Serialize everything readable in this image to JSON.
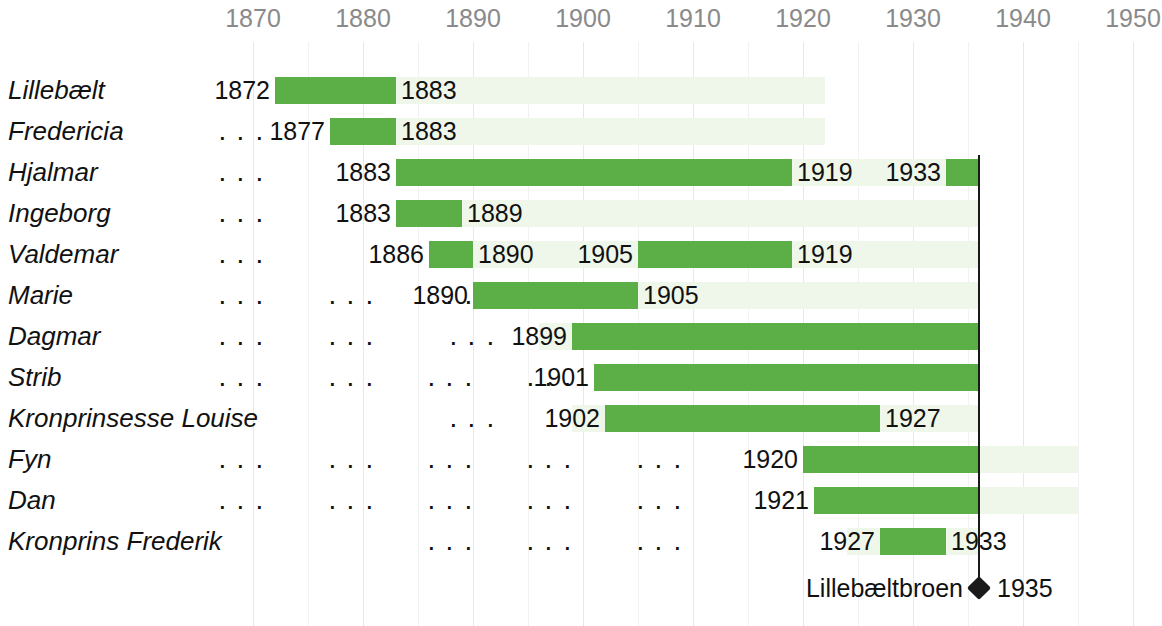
{
  "chart_data": {
    "type": "bar",
    "subtype": "gantt-timeline",
    "title": "",
    "xlabel": "",
    "ylabel": "",
    "xlim": [
      1865,
      1952
    ],
    "grid": true,
    "legend_position": "bottom-right",
    "axis": {
      "ticks": [
        1870,
        1880,
        1890,
        1900,
        1910,
        1920,
        1930,
        1940,
        1950
      ],
      "minor_ticks": [
        1875,
        1885,
        1895,
        1905,
        1915,
        1925,
        1935,
        1945
      ],
      "tick_color": "#8A8A8A"
    },
    "colors": {
      "bar": "#5CAF46",
      "band": "#EFF7EA",
      "gridline": "#E8E8E8",
      "text": "#111111",
      "milestone": "#1A1A1A"
    },
    "categories": [
      "Lillebælt",
      "Fredericia",
      "Hjalmar",
      "Ingeborg",
      "Valdemar",
      "Marie",
      "Dagmar",
      "Strib",
      "Kronprinsesse Louise",
      "Fyn",
      "Dan",
      "Kronprins Frederik"
    ],
    "rows": [
      {
        "label": "Lillebælt",
        "dots": [],
        "band": [
          1872,
          1922
        ],
        "segments": [
          {
            "start": 1872,
            "end": 1883,
            "start_label": "1872",
            "end_label": "1883"
          }
        ]
      },
      {
        "label": "Fredericia",
        "dots": [
          1869
        ],
        "band": [
          1877,
          1922
        ],
        "segments": [
          {
            "start": 1877,
            "end": 1883,
            "start_label": "1877",
            "end_label": "1883"
          }
        ]
      },
      {
        "label": "Hjalmar",
        "dots": [
          1869
        ],
        "band": [
          1883,
          1936
        ],
        "segments": [
          {
            "start": 1883,
            "end": 1919,
            "start_label": "1883",
            "end_label": "1919"
          },
          {
            "start": 1933,
            "end": 1936,
            "start_label": "1933",
            "end_label": ""
          }
        ]
      },
      {
        "label": "Ingeborg",
        "dots": [
          1869
        ],
        "band": [
          1883,
          1936
        ],
        "segments": [
          {
            "start": 1883,
            "end": 1889,
            "start_label": "1883",
            "end_label": "1889"
          }
        ]
      },
      {
        "label": "Valdemar",
        "dots": [
          1869
        ],
        "band": [
          1886,
          1936
        ],
        "segments": [
          {
            "start": 1886,
            "end": 1890,
            "start_label": "1886",
            "end_label": "1890"
          },
          {
            "start": 1905,
            "end": 1919,
            "start_label": "1905",
            "end_label": "1919"
          }
        ]
      },
      {
        "label": "Marie",
        "dots": [
          1869,
          1879,
          1888
        ],
        "band": [
          1890,
          1936
        ],
        "segments": [
          {
            "start": 1890,
            "end": 1905,
            "start_label": "1890",
            "end_label": "1905"
          }
        ]
      },
      {
        "label": "Dagmar",
        "dots": [
          1869,
          1879,
          1890
        ],
        "band": [
          1896,
          1936
        ],
        "segments": [
          {
            "start": 1899,
            "end": 1936,
            "start_label": "1899",
            "end_label": ""
          }
        ]
      },
      {
        "label": "Strib",
        "dots": [
          1869,
          1879,
          1888,
          1897
        ],
        "band": [
          1901,
          1936
        ],
        "segments": [
          {
            "start": 1901,
            "end": 1936,
            "start_label": "1901",
            "end_label": ""
          }
        ]
      },
      {
        "label": "Kronprinsesse Louise",
        "dots": [
          1890
        ],
        "band": [
          1899,
          1936
        ],
        "segments": [
          {
            "start": 1902,
            "end": 1927,
            "start_label": "1902",
            "end_label": "1927"
          }
        ]
      },
      {
        "label": "Fyn",
        "dots": [
          1869,
          1879,
          1888,
          1897,
          1907
        ],
        "band": [
          1920,
          1945
        ],
        "segments": [
          {
            "start": 1920,
            "end": 1936,
            "start_label": "1920",
            "end_label": ""
          }
        ]
      },
      {
        "label": "Dan",
        "dots": [
          1869,
          1879,
          1888,
          1897,
          1907
        ],
        "band": [
          1921,
          1945
        ],
        "segments": [
          {
            "start": 1921,
            "end": 1936,
            "start_label": "1921",
            "end_label": ""
          }
        ]
      },
      {
        "label": "Kronprins Frederik",
        "dots": [
          1888,
          1897,
          1907
        ],
        "band": [
          1924,
          1936
        ],
        "segments": [
          {
            "start": 1927,
            "end": 1933,
            "start_label": "1927",
            "end_label": "1933"
          }
        ]
      }
    ],
    "milestone": {
      "year": 1936,
      "marker": "diamond",
      "left_label": "Lillebæltbroen",
      "right_label": "1935",
      "value": 1935
    }
  }
}
